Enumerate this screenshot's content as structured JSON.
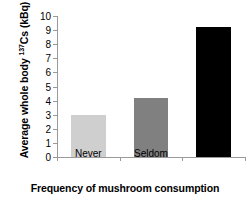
{
  "chart_data": {
    "type": "bar",
    "title": "",
    "categories": [
      "Never",
      "Seldom",
      "Often"
    ],
    "values": [
      3.0,
      4.2,
      9.2
    ],
    "series": [
      {
        "name": "Average whole body 137Cs (kBq)",
        "values": [
          3.0,
          4.2,
          9.2
        ],
        "colors": [
          "#cfcfcf",
          "#808080",
          "#000000"
        ]
      }
    ],
    "xlabel": "Frequency of mushroom consumption",
    "ylabel": "Average whole body 137Cs (kBq)",
    "ylabel_prefix": "Average whole body ",
    "ylabel_superscript": "137",
    "ylabel_suffix": "Cs (kBq)",
    "ylim": [
      0,
      10
    ],
    "ytick_step": 1,
    "ytick_labels": [
      "0",
      "1",
      "2",
      "3",
      "4",
      "5",
      "6",
      "7",
      "8",
      "9",
      "10"
    ],
    "grid": false,
    "legend": false,
    "legend_position": "none",
    "axis_color": "#9a9a9a",
    "text_color": "#000000",
    "background": "#ffffff"
  }
}
